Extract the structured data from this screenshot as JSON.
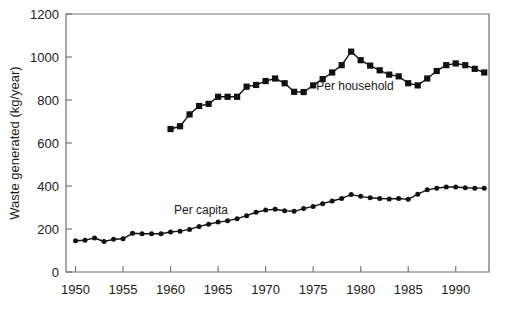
{
  "chart_data": {
    "type": "line",
    "title": "",
    "subtitle": "",
    "xlabel": "",
    "ylabel": "Waste generated (kg/year)",
    "xlim": [
      1949,
      1993.5
    ],
    "ylim": [
      0,
      1200
    ],
    "grid": false,
    "legend_position": "inline-annotations",
    "x_ticks": [
      1950,
      1955,
      1960,
      1965,
      1970,
      1975,
      1980,
      1985,
      1990
    ],
    "x_tick_labels": [
      "1950",
      "1955",
      "1960",
      "1965",
      "1970",
      "1975",
      "1980",
      "1985",
      "1990"
    ],
    "y_ticks": [
      0,
      200,
      400,
      600,
      800,
      1000,
      1200
    ],
    "y_tick_labels": [
      "0",
      "200",
      "400",
      "600",
      "800",
      "1000",
      "1200"
    ],
    "series": [
      {
        "name": "Per household",
        "marker": "square",
        "annotation": "Per household",
        "annotation_x": 1979.4,
        "annotation_y": 845,
        "x": [
          1960,
          1961,
          1962,
          1963,
          1964,
          1965,
          1966,
          1967,
          1968,
          1969,
          1970,
          1971,
          1972,
          1973,
          1974,
          1975,
          1976,
          1977,
          1978,
          1979,
          1980,
          1981,
          1982,
          1983,
          1984,
          1985,
          1986,
          1987,
          1988,
          1989,
          1990,
          1991,
          1992,
          1993
        ],
        "values": [
          665,
          678,
          733,
          772,
          782,
          815,
          815,
          815,
          862,
          870,
          888,
          900,
          878,
          838,
          837,
          868,
          897,
          928,
          962,
          1025,
          985,
          960,
          938,
          918,
          910,
          878,
          868,
          900,
          935,
          962,
          970,
          962,
          945,
          928
        ]
      },
      {
        "name": "Per capita",
        "marker": "circle",
        "annotation": "Per capita",
        "annotation_x": 1963.2,
        "annotation_y": 268,
        "x": [
          1950,
          1951,
          1952,
          1953,
          1954,
          1955,
          1956,
          1957,
          1958,
          1959,
          1960,
          1961,
          1962,
          1963,
          1964,
          1965,
          1966,
          1967,
          1968,
          1969,
          1970,
          1971,
          1972,
          1973,
          1974,
          1975,
          1976,
          1977,
          1978,
          1979,
          1980,
          1981,
          1982,
          1983,
          1984,
          1985,
          1986,
          1987,
          1988,
          1989,
          1990,
          1991,
          1992,
          1993
        ],
        "values": [
          145,
          148,
          158,
          142,
          152,
          155,
          180,
          178,
          178,
          178,
          186,
          190,
          198,
          212,
          222,
          232,
          238,
          248,
          262,
          278,
          288,
          292,
          285,
          282,
          295,
          305,
          318,
          330,
          342,
          360,
          352,
          345,
          342,
          340,
          342,
          338,
          362,
          382,
          390,
          395,
          395,
          392,
          390,
          390
        ]
      }
    ]
  }
}
